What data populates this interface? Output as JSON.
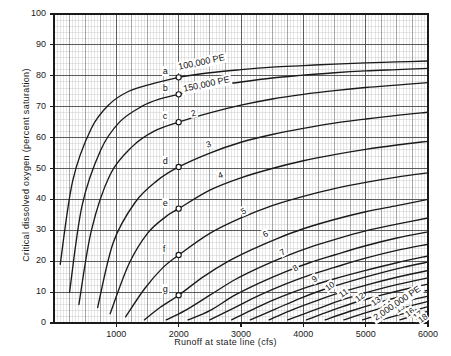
{
  "chart_data": {
    "type": "line",
    "title": "",
    "xlabel": "Runoff at state line (cfs)",
    "ylabel": "Critical dissolved oxygen (percent saturation)",
    "xlim": [
      0,
      6000
    ],
    "ylim": [
      0,
      100
    ],
    "xticks": [
      "1000",
      "2000",
      "3000",
      "4000",
      "5000",
      "6000"
    ],
    "xtick_values": [
      1000,
      2000,
      3000,
      4000,
      5000,
      6000
    ],
    "yticks": [
      "0",
      "10",
      "20",
      "30",
      "40",
      "50",
      "60",
      "70",
      "80",
      "90",
      "100"
    ],
    "ytick_values": [
      0,
      10,
      20,
      30,
      40,
      50,
      60,
      70,
      80,
      90,
      100
    ],
    "grid": "log-log graph paper style fine grid, minor and major rulings",
    "legend_position": "inline curve labels",
    "annotations": [
      {
        "text": "100,000 PE",
        "x": 2350,
        "y": 84
      },
      {
        "text": "150,000 PE",
        "x": 2420,
        "y": 77
      },
      {
        "text": "2,000,000 PE",
        "x": 5420,
        "y": 6
      }
    ],
    "series": [
      {
        "name": "100,000 PE",
        "label": "100,000 PE",
        "marker_point": "a",
        "points": [
          [
            100,
            19
          ],
          [
            300,
            46
          ],
          [
            600,
            63
          ],
          [
            900,
            71
          ],
          [
            1200,
            75
          ],
          [
            1500,
            77
          ],
          [
            2000,
            79.5
          ],
          [
            2500,
            81
          ],
          [
            3000,
            82
          ],
          [
            3500,
            82.8
          ],
          [
            4000,
            83.3
          ],
          [
            4500,
            83.8
          ],
          [
            5000,
            84.2
          ],
          [
            5500,
            84.5
          ],
          [
            6000,
            84.8
          ]
        ]
      },
      {
        "name": "150,000 PE",
        "label": "150,000 PE",
        "marker_point": "b",
        "points": [
          [
            250,
            10
          ],
          [
            450,
            38
          ],
          [
            750,
            56
          ],
          [
            1050,
            65
          ],
          [
            1400,
            70
          ],
          [
            1700,
            72.5
          ],
          [
            2000,
            74
          ],
          [
            2500,
            76.5
          ],
          [
            3000,
            78
          ],
          [
            3500,
            79.3
          ],
          [
            4000,
            80.2
          ],
          [
            4500,
            81
          ],
          [
            5000,
            81.6
          ],
          [
            5500,
            82
          ],
          [
            6000,
            82.4
          ]
        ]
      },
      {
        "name": "2",
        "label": "2",
        "marker_point": "c",
        "points": [
          [
            400,
            6
          ],
          [
            600,
            30
          ],
          [
            900,
            48
          ],
          [
            1250,
            57
          ],
          [
            1600,
            62
          ],
          [
            2000,
            65
          ],
          [
            2500,
            68
          ],
          [
            3000,
            70.5
          ],
          [
            3500,
            72.5
          ],
          [
            4000,
            74
          ],
          [
            4500,
            75.2
          ],
          [
            5000,
            76.2
          ],
          [
            5500,
            77
          ],
          [
            6000,
            77.8
          ]
        ]
      },
      {
        "name": "3",
        "label": "3",
        "marker_point": "d",
        "points": [
          [
            700,
            5
          ],
          [
            950,
            26
          ],
          [
            1300,
            39
          ],
          [
            1650,
            46
          ],
          [
            2000,
            50.5
          ],
          [
            2500,
            55
          ],
          [
            3000,
            58.5
          ],
          [
            3500,
            61
          ],
          [
            4000,
            63
          ],
          [
            4500,
            64.7
          ],
          [
            5000,
            66
          ],
          [
            5500,
            67.2
          ],
          [
            6000,
            68.2
          ]
        ]
      },
      {
        "name": "4",
        "label": "4",
        "marker_point": "e",
        "points": [
          [
            900,
            3
          ],
          [
            1200,
            19
          ],
          [
            1500,
            29
          ],
          [
            1800,
            34.5
          ],
          [
            2000,
            37
          ],
          [
            2500,
            43
          ],
          [
            3000,
            47
          ],
          [
            3500,
            50
          ],
          [
            4000,
            52.5
          ],
          [
            4500,
            54.5
          ],
          [
            5000,
            56.2
          ],
          [
            5500,
            57.6
          ],
          [
            6000,
            58.8
          ]
        ]
      },
      {
        "name": "5",
        "label": "5",
        "marker_point": "f",
        "points": [
          [
            1150,
            2
          ],
          [
            1450,
            11
          ],
          [
            1750,
            18
          ],
          [
            2000,
            22
          ],
          [
            2500,
            29
          ],
          [
            3000,
            34
          ],
          [
            3500,
            38
          ],
          [
            4000,
            41
          ],
          [
            4500,
            43.5
          ],
          [
            5000,
            45.5
          ],
          [
            5500,
            47.2
          ],
          [
            6000,
            48.6
          ]
        ]
      },
      {
        "name": "6",
        "label": "6",
        "marker_point": "g",
        "points": [
          [
            1450,
            1
          ],
          [
            1700,
            5
          ],
          [
            2000,
            9
          ],
          [
            2400,
            15
          ],
          [
            2800,
            20
          ],
          [
            3200,
            24
          ],
          [
            3600,
            27.5
          ],
          [
            4000,
            30.5
          ],
          [
            4500,
            33.5
          ],
          [
            5000,
            36
          ],
          [
            5500,
            38
          ],
          [
            6000,
            40
          ]
        ]
      },
      {
        "name": "7",
        "label": "7",
        "marker_point": null,
        "points": [
          [
            1800,
            1
          ],
          [
            2100,
            4
          ],
          [
            2500,
            9
          ],
          [
            2900,
            14
          ],
          [
            3300,
            18
          ],
          [
            3700,
            21.5
          ],
          [
            4100,
            24.5
          ],
          [
            4500,
            27
          ],
          [
            5000,
            29.8
          ],
          [
            5500,
            32
          ],
          [
            6000,
            34
          ]
        ]
      },
      {
        "name": "8",
        "label": "8",
        "marker_point": null,
        "points": [
          [
            2150,
            1
          ],
          [
            2500,
            4
          ],
          [
            2900,
            9
          ],
          [
            3300,
            13
          ],
          [
            3700,
            16.5
          ],
          [
            4100,
            19.5
          ],
          [
            4500,
            22
          ],
          [
            5000,
            25
          ],
          [
            5500,
            27.5
          ],
          [
            6000,
            29.5
          ]
        ]
      },
      {
        "name": "9",
        "label": "9",
        "marker_point": null,
        "points": [
          [
            2500,
            1
          ],
          [
            2900,
            5
          ],
          [
            3300,
            9
          ],
          [
            3700,
            12.5
          ],
          [
            4100,
            15.5
          ],
          [
            4500,
            18
          ],
          [
            5000,
            21
          ],
          [
            5500,
            23.5
          ],
          [
            6000,
            25.5
          ]
        ]
      },
      {
        "name": "10",
        "label": "10",
        "marker_point": null,
        "points": [
          [
            2850,
            1
          ],
          [
            3250,
            5
          ],
          [
            3650,
            8.5
          ],
          [
            4050,
            11.5
          ],
          [
            4450,
            14
          ],
          [
            5000,
            17
          ],
          [
            5500,
            19.5
          ],
          [
            6000,
            21.7
          ]
        ]
      },
      {
        "name": "11",
        "label": "11",
        "marker_point": null,
        "points": [
          [
            3150,
            1
          ],
          [
            3550,
            4.5
          ],
          [
            3950,
            8
          ],
          [
            4350,
            11
          ],
          [
            4750,
            13.5
          ],
          [
            5200,
            16
          ],
          [
            5600,
            18
          ],
          [
            6000,
            19.7
          ]
        ]
      },
      {
        "name": "12",
        "label": "12",
        "marker_point": null,
        "points": [
          [
            3450,
            1
          ],
          [
            3850,
            4.5
          ],
          [
            4250,
            7.5
          ],
          [
            4650,
            10.2
          ],
          [
            5050,
            12.5
          ],
          [
            5500,
            14.8
          ],
          [
            6000,
            17
          ]
        ]
      },
      {
        "name": "13",
        "label": "13",
        "marker_point": null,
        "points": [
          [
            3750,
            1
          ],
          [
            4150,
            4
          ],
          [
            4550,
            7
          ],
          [
            4950,
            9.5
          ],
          [
            5350,
            11.7
          ],
          [
            5700,
            13.3
          ],
          [
            6000,
            14.6
          ]
        ]
      },
      {
        "name": "14",
        "label": "14",
        "marker_point": null,
        "points": [
          [
            4050,
            1
          ],
          [
            4450,
            4
          ],
          [
            4850,
            6.8
          ],
          [
            5250,
            9
          ],
          [
            5650,
            11
          ],
          [
            6000,
            12.6
          ]
        ]
      },
      {
        "name": "15",
        "label": "15",
        "marker_point": null,
        "points": [
          [
            4350,
            1
          ],
          [
            4750,
            3.8
          ],
          [
            5150,
            6.3
          ],
          [
            5550,
            8.5
          ],
          [
            6000,
            10.6
          ]
        ]
      },
      {
        "name": "16",
        "label": "16",
        "marker_point": null,
        "points": [
          [
            4650,
            1
          ],
          [
            5050,
            3.6
          ],
          [
            5450,
            6
          ],
          [
            5800,
            7.8
          ],
          [
            6000,
            8.7
          ]
        ]
      },
      {
        "name": "17",
        "label": "17",
        "marker_point": null,
        "points": [
          [
            4950,
            1
          ],
          [
            5350,
            3.5
          ],
          [
            5750,
            5.7
          ],
          [
            6000,
            7
          ]
        ]
      },
      {
        "name": "18",
        "label": "18",
        "marker_point": null,
        "points": [
          [
            5250,
            1
          ],
          [
            5650,
            3.3
          ],
          [
            6000,
            5.3
          ]
        ]
      },
      {
        "name": "2,000,000 PE",
        "label": "2,000,000 PE",
        "marker_point": null,
        "points": [
          [
            5550,
            1
          ],
          [
            5850,
            2.9
          ],
          [
            6000,
            3.8
          ]
        ]
      }
    ],
    "curve_labels": [
      {
        "text": "2",
        "x": 2250,
        "y": 67.5,
        "rotate": -16
      },
      {
        "text": "3",
        "x": 2480,
        "y": 57.5,
        "rotate": -20
      },
      {
        "text": "4",
        "x": 2680,
        "y": 47.5,
        "rotate": -22
      },
      {
        "text": "5",
        "x": 3050,
        "y": 36,
        "rotate": -26
      },
      {
        "text": "6",
        "x": 3400,
        "y": 28.5,
        "rotate": -30
      },
      {
        "text": "7",
        "x": 3680,
        "y": 22.5,
        "rotate": -32
      },
      {
        "text": "8",
        "x": 3880,
        "y": 17.5,
        "rotate": -34
      },
      {
        "text": "9",
        "x": 4180,
        "y": 14,
        "rotate": -36
      },
      {
        "text": "10",
        "x": 4400,
        "y": 11.5,
        "rotate": -36
      },
      {
        "text": "11",
        "x": 4620,
        "y": 9.5,
        "rotate": -36
      },
      {
        "text": "12",
        "x": 4880,
        "y": 8,
        "rotate": -36
      },
      {
        "text": "13",
        "x": 5130,
        "y": 6.8,
        "rotate": -36
      },
      {
        "text": "14",
        "x": 5330,
        "y": 5.6,
        "rotate": -36
      },
      {
        "text": "15",
        "x": 5520,
        "y": 4.4,
        "rotate": -36
      },
      {
        "text": "16",
        "x": 5680,
        "y": 3.2,
        "rotate": -36
      },
      {
        "text": "17",
        "x": 5800,
        "y": 2.2,
        "rotate": -36
      },
      {
        "text": "18",
        "x": 5880,
        "y": 1.2,
        "rotate": -36
      }
    ],
    "marker_points": [
      {
        "label": "a",
        "x": 2000,
        "y": 79.5
      },
      {
        "label": "b",
        "x": 2000,
        "y": 74
      },
      {
        "label": "c",
        "x": 2000,
        "y": 65
      },
      {
        "label": "d",
        "x": 2000,
        "y": 50.5
      },
      {
        "label": "e",
        "x": 2000,
        "y": 37
      },
      {
        "label": "f",
        "x": 2000,
        "y": 22
      },
      {
        "label": "g",
        "x": 2000,
        "y": 9
      }
    ],
    "colors": {
      "curve": "#1a1a1a",
      "grid_minor": "#c8c8c8",
      "grid_major": "#6e6e6e",
      "axis": "#1a1a1a",
      "background": "#ffffff",
      "text": "#1a1a1a"
    }
  }
}
